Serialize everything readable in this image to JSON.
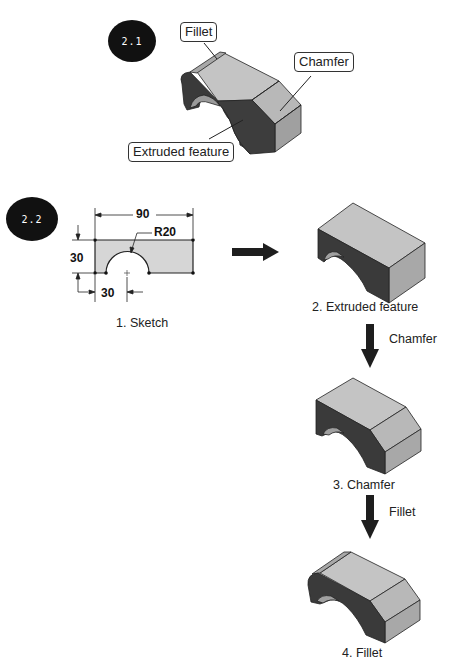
{
  "figure_2_1": {
    "badge": "2.1",
    "callouts": {
      "fillet": "Fillet",
      "chamfer": "Chamfer",
      "extruded": "Extruded feature"
    }
  },
  "figure_2_2": {
    "badge": "2.2",
    "sketch": {
      "caption": "1. Sketch",
      "dimensions": {
        "width": "90",
        "height": "30",
        "offset": "30",
        "radius": "R20"
      }
    },
    "steps": [
      {
        "caption": "2. Extruded feature"
      },
      {
        "caption": "3. Chamfer",
        "arrow_label": "Chamfer"
      },
      {
        "caption": "4. Fillet",
        "arrow_label": "Fillet"
      }
    ]
  },
  "colors": {
    "badge_fill": "#111111",
    "top_face": "#c4c4c4",
    "side_face": "#a9a9a9",
    "dark_face": "#3a3a3a",
    "sketch_fill": "#d6d6d6",
    "arrow": "#1e1e1e"
  }
}
